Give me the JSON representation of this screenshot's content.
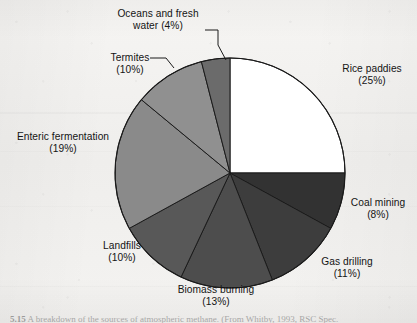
{
  "chart_data": {
    "type": "pie",
    "title": "",
    "subtitle": "",
    "xlabel": "",
    "ylabel": "",
    "legend_position": "none",
    "grid": false,
    "label_format": "name (percent%)",
    "start_angle_deg": 0,
    "direction": "clockwise",
    "units": "percent",
    "total": 100,
    "categories": [
      "Rice paddies",
      "Coal mining",
      "Gas drilling",
      "Biomass burning",
      "Landfills",
      "Enteric fermentation",
      "Termites",
      "Oceans and fresh water"
    ],
    "values": [
      25,
      8,
      11,
      13,
      10,
      19,
      10,
      4
    ],
    "slices": [
      {
        "name": "Rice paddies",
        "value": 25,
        "percent_text": "(25%)",
        "color": "#ffffff",
        "start_deg": 0,
        "end_deg": 90,
        "label_anchor": "left",
        "leader": false
      },
      {
        "name": "Coal mining",
        "value": 8,
        "percent_text": "(8%)",
        "color": "#323232",
        "start_deg": 90,
        "end_deg": 118.8,
        "label_anchor": "left",
        "leader": false
      },
      {
        "name": "Gas drilling",
        "value": 11,
        "percent_text": "(11%)",
        "color": "#3d3d3d",
        "start_deg": 118.8,
        "end_deg": 158.4,
        "label_anchor": "left",
        "leader": false
      },
      {
        "name": "Biomass burning",
        "value": 13,
        "percent_text": "(13%)",
        "color": "#4d4d4d",
        "start_deg": 158.4,
        "end_deg": 205.2,
        "label_anchor": "center",
        "leader": false
      },
      {
        "name": "Landfills",
        "value": 10,
        "percent_text": "(10%)",
        "color": "#585858",
        "start_deg": 205.2,
        "end_deg": 241.2,
        "label_anchor": "right",
        "leader": false
      },
      {
        "name": "Enteric fermentation",
        "value": 19,
        "percent_text": "(19%)",
        "color": "#8a8a8a",
        "start_deg": 241.2,
        "end_deg": 309.6,
        "label_anchor": "right",
        "leader": false
      },
      {
        "name": "Termites",
        "value": 10,
        "percent_text": "(10%)",
        "color": "#909090",
        "start_deg": 309.6,
        "end_deg": 345.6,
        "label_anchor": "right",
        "leader": true
      },
      {
        "name": "Oceans and fresh water",
        "value": 4,
        "percent_text": "(4%)",
        "color": "#6b6b6b",
        "start_deg": 345.6,
        "end_deg": 360,
        "label_anchor": "center",
        "leader": true
      }
    ]
  },
  "labels": {
    "oceans": {
      "name": "Oceans and fresh",
      "name2": "water (4%)",
      "percent": "(4%)"
    },
    "termites": {
      "name": "Termites",
      "percent": "(10%)"
    },
    "enteric": {
      "name": "Enteric fermentation",
      "percent": "(19%)"
    },
    "landfills": {
      "name": "Landfills",
      "percent": "(10%)"
    },
    "biomass": {
      "name": "Biomass burning",
      "percent": "(13%)"
    },
    "gas": {
      "name": "Gas drilling",
      "percent": "(11%)"
    },
    "coal": {
      "name": "Coal mining",
      "percent": "(8%)"
    },
    "rice": {
      "name": "Rice paddies",
      "percent": "(25%)"
    }
  },
  "caption": {
    "number": "5.15",
    "text": "A breakdown of the sources of atmospheric methane. (From Whitby, 1993, RSC Spec."
  },
  "style": {
    "outline_color": "#1b1b1b",
    "leader_color": "#1b1b1b",
    "text_color": "#141414",
    "page_color": "#f3f2f0"
  }
}
